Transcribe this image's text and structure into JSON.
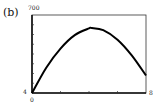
{
  "panel_label": "(b)",
  "chart_data": {
    "type": "line",
    "title": "",
    "xlabel": "",
    "ylabel": "",
    "xlim": [
      0,
      8
    ],
    "ylim": [
      4,
      700
    ],
    "x_tick_labels": [
      "0",
      "8"
    ],
    "y_tick_labels": [
      "4",
      "700"
    ],
    "x_minor_ticks": [
      2,
      4,
      6
    ],
    "y_minor_tick_count": 7,
    "grid": false,
    "legend": null,
    "series": [
      {
        "name": "curve",
        "x": [
          0,
          1,
          2,
          3,
          4,
          4.2,
          5,
          6,
          7,
          8
        ],
        "y": [
          4,
          230,
          400,
          520,
          580,
          584,
          565,
          480,
          340,
          160
        ]
      }
    ]
  },
  "labels": {
    "y_max": "700",
    "y_min": "4",
    "x_min": "0",
    "x_max": "8"
  }
}
